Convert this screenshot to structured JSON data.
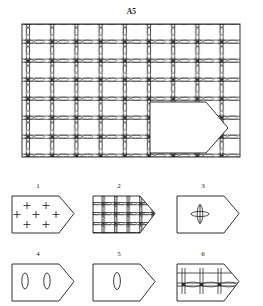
{
  "document": {
    "type": "technical-line-drawing",
    "subject": "woven wire mesh panel with pentagonal cut-out detail",
    "background_color": "#ffffff",
    "ink_color": "#1a1a1a"
  },
  "main_figure": {
    "title": "A5",
    "shape": "rectangle",
    "grid": {
      "columns": 9,
      "rows": 7,
      "intersection_marker": "lens-knuckle",
      "wire_style": "double-line",
      "x": 22,
      "y": 24,
      "width": 218,
      "height": 133
    },
    "overlay": {
      "name": "pentagon-cutout",
      "description": "white pentagon pointing right overlaying lower-right of mesh",
      "x": 150,
      "y": 102,
      "width": 78,
      "height": 51,
      "fill": "#ffffff",
      "stroke": "#1a1a1a"
    }
  },
  "detail_figures": [
    {
      "number": "1",
      "label_x": 37,
      "label_y": 182,
      "shape": "pentagon",
      "content": "seven plus-sign cross markers",
      "markers": 7,
      "marker_type": "plus",
      "box": {
        "x": 14,
        "y": 192,
        "width": 62,
        "height": 45
      }
    },
    {
      "number": "2",
      "label_x": 122,
      "label_y": 182,
      "shape": "pentagon",
      "content": "woven mesh grid fill, 4 by 4 cells",
      "grid_columns": 4,
      "grid_rows": 4,
      "box": {
        "x": 94,
        "y": 192,
        "width": 62,
        "height": 45
      }
    },
    {
      "number": "3",
      "label_x": 205,
      "label_y": 182,
      "shape": "pentagon",
      "content": "single crossing knuckle with vertical and horizontal lens",
      "markers": 1,
      "marker_type": "lens-cross",
      "box": {
        "x": 176,
        "y": 192,
        "width": 62,
        "height": 45
      }
    },
    {
      "number": "4",
      "label_x": 37,
      "label_y": 250,
      "shape": "pentagon",
      "content": "two vertical wire loops",
      "markers": 2,
      "marker_type": "vertical-loop",
      "box": {
        "x": 14,
        "y": 260,
        "width": 62,
        "height": 45
      }
    },
    {
      "number": "5",
      "label_x": 122,
      "label_y": 250,
      "shape": "pentagon",
      "content": "one vertical wire loop",
      "markers": 1,
      "marker_type": "vertical-loop",
      "box": {
        "x": 94,
        "y": 260,
        "width": 62,
        "height": 45
      }
    },
    {
      "number": "6",
      "label_x": 205,
      "label_y": 250,
      "shape": "pentagon",
      "content": "horizontal wire band with vertical posts and horizontal lenses",
      "markers": 3,
      "marker_type": "horizontal-band",
      "box": {
        "x": 176,
        "y": 260,
        "width": 62,
        "height": 45
      }
    }
  ]
}
